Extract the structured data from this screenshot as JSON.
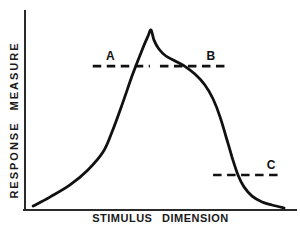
{
  "figure": {
    "background": "#ffffff",
    "ink_color": "#111111"
  },
  "chart_data": {
    "type": "line",
    "title": "",
    "xlabel": "STIMULUS DIMENSION",
    "ylabel": "RESPONSE MEASURE",
    "x_axis": {
      "min": 0,
      "max": 1,
      "ticks": [],
      "visible_scale": false
    },
    "y_axis": {
      "min": 0,
      "max": 1,
      "ticks": [],
      "visible_scale": false
    },
    "grid": false,
    "legend": false,
    "series": [
      {
        "name": "response-gradient-curve",
        "style": "solid",
        "points": [
          [
            0.03,
            0.02
          ],
          [
            0.092,
            0.065
          ],
          [
            0.166,
            0.126
          ],
          [
            0.232,
            0.201
          ],
          [
            0.288,
            0.291
          ],
          [
            0.321,
            0.392
          ],
          [
            0.358,
            0.528
          ],
          [
            0.395,
            0.673
          ],
          [
            0.432,
            0.804
          ],
          [
            0.454,
            0.874
          ],
          [
            0.465,
            0.905
          ],
          [
            0.476,
            0.854
          ],
          [
            0.494,
            0.809
          ],
          [
            0.52,
            0.774
          ],
          [
            0.554,
            0.749
          ],
          [
            0.59,
            0.722
          ],
          [
            0.627,
            0.683
          ],
          [
            0.664,
            0.628
          ],
          [
            0.694,
            0.558
          ],
          [
            0.72,
            0.467
          ],
          [
            0.742,
            0.367
          ],
          [
            0.764,
            0.266
          ],
          [
            0.786,
            0.176
          ],
          [
            0.808,
            0.116
          ],
          [
            0.838,
            0.07
          ],
          [
            0.875,
            0.04
          ],
          [
            0.911,
            0.025
          ],
          [
            0.956,
            0.01
          ]
        ]
      }
    ],
    "reference_lines": [
      {
        "label": "A",
        "style": "dashed",
        "y": 0.723,
        "x_start": 0.25,
        "x_end": 0.461,
        "label_x": 0.315
      },
      {
        "label": "B",
        "style": "dashed",
        "y": 0.723,
        "x_start": 0.498,
        "x_end": 0.742,
        "label_x": 0.686
      },
      {
        "label": "C",
        "style": "dashed",
        "y": 0.176,
        "x_start": 0.694,
        "x_end": 0.948,
        "label_x": 0.908
      }
    ]
  }
}
